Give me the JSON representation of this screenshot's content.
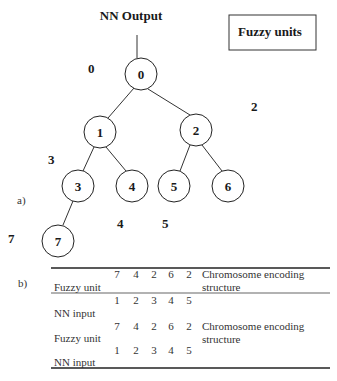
{
  "panel_a": {
    "label": "a)",
    "title": "NN Output",
    "legend_box": "Fuzzy units",
    "nodes": [
      {
        "id": "0",
        "cx": 141,
        "cy": 74
      },
      {
        "id": "1",
        "cx": 100,
        "cy": 132
      },
      {
        "id": "2",
        "cx": 196,
        "cy": 130
      },
      {
        "id": "3",
        "cx": 78,
        "cy": 186
      },
      {
        "id": "4",
        "cx": 132,
        "cy": 186
      },
      {
        "id": "5",
        "cx": 174,
        "cy": 186
      },
      {
        "id": "6",
        "cx": 228,
        "cy": 186
      },
      {
        "id": "7",
        "cx": 58,
        "cy": 241
      }
    ],
    "edges": [
      [
        "0",
        "1"
      ],
      [
        "0",
        "2"
      ],
      [
        "1",
        "3"
      ],
      [
        "1",
        "4"
      ],
      [
        "2",
        "5"
      ],
      [
        "2",
        "6"
      ],
      [
        "3",
        "7"
      ]
    ],
    "outside_labels": [
      {
        "text": "0",
        "x": 88,
        "y": 73
      },
      {
        "text": "2",
        "x": 255,
        "y": 111
      },
      {
        "text": "3",
        "x": 51,
        "y": 164
      },
      {
        "text": "4",
        "x": 120,
        "y": 228
      },
      {
        "text": "5",
        "x": 166,
        "y": 228
      },
      {
        "text": "7",
        "x": 12,
        "y": 243
      }
    ]
  },
  "panel_b": {
    "label": "b)",
    "rows": [
      {
        "label": "Fuzzy unit",
        "values": [
          "7",
          "4",
          "2",
          "6",
          "2"
        ],
        "note_line1": "Chromosome encoding",
        "note_line2": "structure"
      },
      {
        "label": "NN input",
        "values": [
          "1",
          "2",
          "3",
          "4",
          "5"
        ]
      },
      {
        "label": "Fuzzy unit",
        "values": [
          "7",
          "4",
          "2",
          "6",
          "2"
        ],
        "note_line1": "Chromosome encoding",
        "note_line2": "structure"
      },
      {
        "label": "NN input",
        "values": [
          "1",
          "2",
          "3",
          "4",
          "5"
        ]
      }
    ]
  }
}
